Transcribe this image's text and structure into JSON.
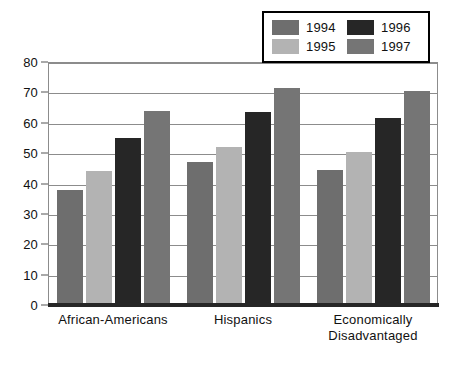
{
  "chart_data": {
    "type": "bar",
    "title": "",
    "xlabel": "",
    "ylabel": "",
    "ylim": [
      0,
      80
    ],
    "ytick_step": 10,
    "yticks": [
      80,
      70,
      60,
      50,
      40,
      30,
      20,
      10,
      0
    ],
    "grid": true,
    "legend_position": "top-right",
    "categories": [
      "African-Americans",
      "Hispanics",
      "Economically\nDisadvantaged"
    ],
    "series": [
      {
        "name": "1994",
        "color": "#6e6e6e",
        "values": [
          38,
          47,
          44.5
        ]
      },
      {
        "name": "1995",
        "color": "#b3b3b3",
        "values": [
          44,
          52,
          50.5
        ]
      },
      {
        "name": "1996",
        "color": "#262626",
        "values": [
          55,
          63.5,
          61.5
        ]
      },
      {
        "name": "1997",
        "color": "#757575",
        "values": [
          64,
          71.5,
          70.5
        ]
      }
    ]
  },
  "legend": {
    "entries": [
      {
        "label": "1994"
      },
      {
        "label": "1996"
      },
      {
        "label": "1995"
      },
      {
        "label": "1997"
      }
    ]
  },
  "colors": {
    "frame": "#8c8c8c",
    "baseline": "#262626",
    "gridline": "#8c8c8c",
    "text": "#111111",
    "background": "#ffffff"
  }
}
